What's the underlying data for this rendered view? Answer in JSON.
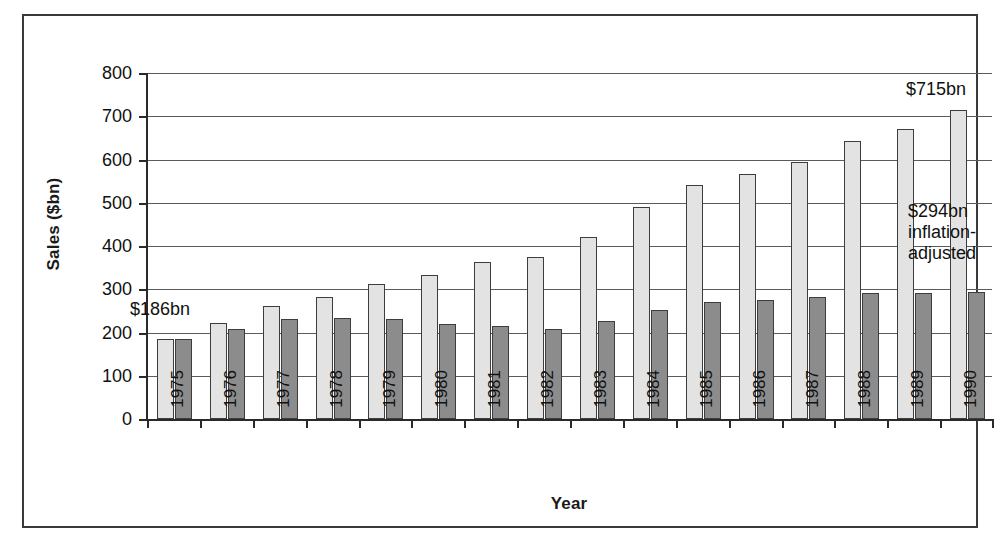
{
  "chart_data": {
    "type": "bar",
    "title": "",
    "subtitle": "",
    "xlabel": "Year",
    "ylabel": "Sales ($bn)",
    "ylim": [
      0,
      800
    ],
    "ytick_step": 100,
    "yticks": [
      0,
      100,
      200,
      300,
      400,
      500,
      600,
      700,
      800
    ],
    "ytick_labels": [
      "0",
      "100",
      "200",
      "300",
      "400",
      "500",
      "600",
      "700",
      "800"
    ],
    "grid": true,
    "legend_position": "none",
    "categories": [
      "1975",
      "1976",
      "1977",
      "1978",
      "1979",
      "1980",
      "1981",
      "1982",
      "1983",
      "1984",
      "1985",
      "1986",
      "1987",
      "1988",
      "1989",
      "1990"
    ],
    "series": [
      {
        "name": "Sales (nominal)",
        "color": "#e3e3e3",
        "values": [
          186,
          222,
          262,
          283,
          313,
          333,
          362,
          374,
          420,
          490,
          540,
          566,
          595,
          642,
          671,
          715
        ]
      },
      {
        "name": "Sales (inflation-adjusted)",
        "color": "#8c8c8c",
        "values": [
          186,
          207,
          231,
          233,
          231,
          219,
          215,
          207,
          226,
          252,
          270,
          275,
          281,
          291,
          291,
          294
        ]
      }
    ],
    "annotations": [
      {
        "id": "first-bar-value",
        "text": "$186bn",
        "lines": [
          "$186bn"
        ],
        "target_category": "1975"
      },
      {
        "id": "last-bar-nominal-value",
        "text": "$715bn",
        "lines": [
          "$715bn"
        ],
        "target_category": "1990"
      },
      {
        "id": "last-bar-adjusted-value",
        "text": "$294bn inflation-adjusted",
        "lines": [
          "$294bn",
          "inflation-",
          "adjusted"
        ],
        "target_category": "1990"
      }
    ]
  },
  "colors": {
    "nominal_fill": "#e3e3e3",
    "adjusted_fill": "#8c8c8c",
    "bar_stroke": "#3d3d3d",
    "axis": "#2a2a2a",
    "gridline": "#5a5a5a",
    "frame": "#3a3a3a",
    "background": "#ffffff",
    "text": "#111111"
  }
}
